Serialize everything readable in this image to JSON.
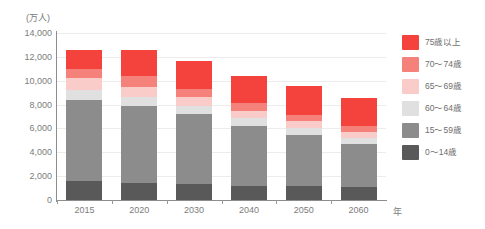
{
  "chart_data": {
    "type": "bar",
    "stacked": true,
    "title": "",
    "subtitle": "",
    "xlabel": "年",
    "ylabel": "(万人)",
    "unit_label": "(万人)",
    "categories": [
      "2015",
      "2020",
      "2030",
      "2040",
      "2050",
      "2060"
    ],
    "ylim": [
      0,
      14000
    ],
    "ytick_values": [
      0,
      2000,
      4000,
      6000,
      8000,
      10000,
      12000,
      14000
    ],
    "ytick_labels": [
      "0",
      "2,000",
      "4,000",
      "6,000",
      "8,000",
      "10,000",
      "12,000",
      "14,000"
    ],
    "grid": true,
    "legend_position": "right",
    "series": [
      {
        "name": "0～14歳",
        "color": "#595959",
        "values": [
          1595,
          1457,
          1321,
          1194,
          1138,
          1104
        ]
      },
      {
        "name": "15～59歳",
        "color": "#8c8c8c",
        "values": [
          6790,
          6436,
          5866,
          4989,
          4314,
          3631
        ]
      },
      {
        "name": "60～64歳",
        "color": "#e0e0e0",
        "values": [
          856,
          742,
          731,
          657,
          561,
          488
        ]
      },
      {
        "name": "65～69歳",
        "color": "#f9ccca",
        "values": [
          953,
          822,
          703,
          664,
          574,
          506
        ]
      },
      {
        "name": "70～74歳",
        "color": "#f4817a",
        "values": [
          772,
          913,
          721,
          654,
          576,
          505
        ]
      },
      {
        "name": "75歳以上",
        "color": "#f4423c",
        "values": [
          1645,
          2179,
          2278,
          2223,
          2385,
          2336
        ]
      }
    ],
    "totals": [
      12610,
      12549,
      11620,
      10381,
      9548,
      8570
    ]
  },
  "legend": {
    "items": [
      {
        "label": "75歳以上",
        "color": "#f4423c"
      },
      {
        "label": "70～74歳",
        "color": "#f4817a"
      },
      {
        "label": "65～69歳",
        "color": "#f9ccca"
      },
      {
        "label": "60～64歳",
        "color": "#e0e0e0"
      },
      {
        "label": "15～59歳",
        "color": "#8c8c8c"
      },
      {
        "label": "0～14歳",
        "color": "#595959"
      }
    ]
  },
  "axes": {
    "y_unit": "(万人)",
    "x_unit": "年"
  }
}
